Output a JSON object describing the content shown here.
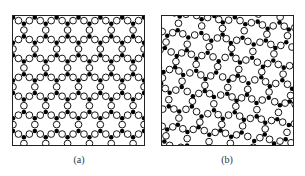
{
  "figure": {
    "panels": [
      {
        "id": "a",
        "label": "(a)",
        "structure": "crystalline",
        "disorder": 0.0,
        "rotation_deg": 0
      },
      {
        "id": "b",
        "label": "(b)",
        "structure": "amorphous",
        "disorder": 0.22,
        "rotation_deg": 7
      }
    ],
    "legend_semantics": {
      "filled_circle": "network-forming atom",
      "open_circle": "bridging atom"
    },
    "lattice": {
      "bond_length_px": 6.4,
      "open_radius_px": 3.4,
      "filled_radius_px": 2.3
    },
    "colors": {
      "stroke": "#111111",
      "fill_open": "#ffffff",
      "fill_filled": "#000000",
      "frame": "#222222",
      "caption": "#333333"
    }
  }
}
